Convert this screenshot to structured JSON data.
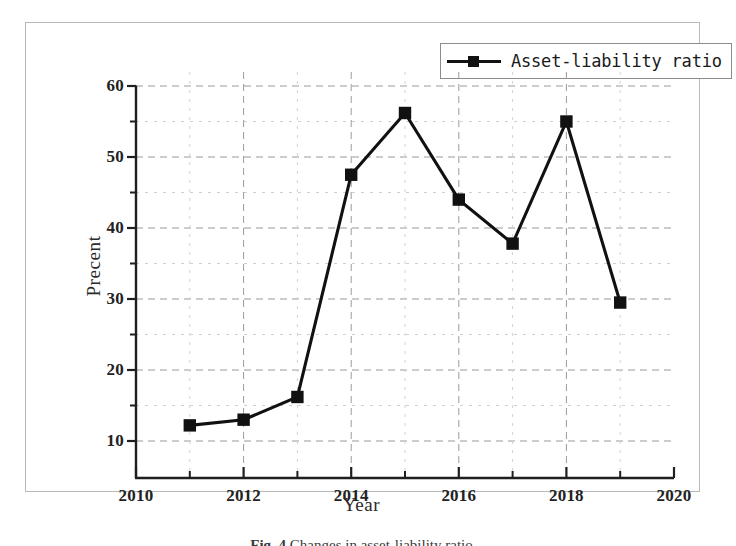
{
  "chart_data": {
    "type": "line",
    "title": "",
    "xlabel": "Year",
    "ylabel": "Precent",
    "xlim": [
      2010,
      2020
    ],
    "ylim": [
      10,
      60
    ],
    "grid": true,
    "legend_position": "top-right",
    "x": [
      2011,
      2012,
      2013,
      2014,
      2015,
      2016,
      2017,
      2018,
      2019
    ],
    "series": [
      {
        "name": "Asset-liability ratio",
        "values": [
          12.2,
          13.0,
          16.2,
          47.5,
          56.2,
          44.0,
          37.8,
          55.0,
          29.5
        ],
        "color": "#111111",
        "marker": "square"
      }
    ],
    "x_ticks_major": [
      2010,
      2012,
      2014,
      2016,
      2018,
      2020
    ],
    "x_ticks_minor": [
      2011,
      2013,
      2015,
      2017,
      2019
    ],
    "y_ticks_major": [
      10,
      20,
      30,
      40,
      50,
      60
    ],
    "y_ticks_minor": [
      15,
      25,
      35,
      45,
      55
    ]
  },
  "legend": {
    "entries": [
      {
        "label": "Asset-liability ratio",
        "marker": "square-marker",
        "color": "#111111"
      }
    ]
  },
  "axes": {
    "x_title": "Year",
    "y_title": "Precent",
    "x_tick_labels": [
      "2010",
      "2012",
      "2014",
      "2016",
      "2018",
      "2020"
    ],
    "y_tick_labels": [
      "10",
      "20",
      "30",
      "40",
      "50",
      "60"
    ]
  },
  "caption": {
    "number": "Fig. 4",
    "text": "Changes in asset-liability ratio"
  }
}
